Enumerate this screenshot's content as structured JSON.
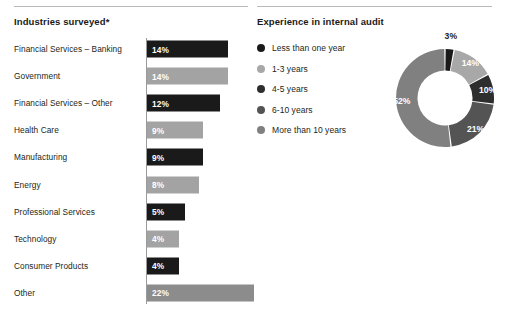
{
  "panels": {
    "industries": {
      "title": "Industries surveyed*"
    },
    "experience": {
      "title": "Experience in internal audit"
    }
  },
  "chart_data": [
    {
      "type": "bar",
      "orientation": "horizontal",
      "title": "Industries surveyed*",
      "xlabel": "",
      "ylabel": "",
      "grid": false,
      "legend": "none",
      "axis_line": true,
      "categories": [
        "Financial Services – Banking",
        "Government",
        "Financial Services – Other",
        "Health Care",
        "Manufacturing",
        "Energy",
        "Professional Services",
        "Technology",
        "Consumer Products",
        "Other"
      ],
      "values": [
        14,
        14,
        12,
        9,
        9,
        8,
        5,
        4,
        4,
        22
      ],
      "value_labels": [
        "14%",
        "14%",
        "12%",
        "9%",
        "9%",
        "8%",
        "5%",
        "4%",
        "4%",
        "22%"
      ],
      "bar_colors": [
        "#1a1a1a",
        "#a3a3a3",
        "#1a1a1a",
        "#a3a3a3",
        "#1a1a1a",
        "#a3a3a3",
        "#1a1a1a",
        "#a3a3a3",
        "#1a1a1a",
        "#8c8c8c"
      ],
      "bar_pixel_widths": [
        81,
        81,
        73,
        56,
        56,
        52,
        38,
        32,
        32,
        107
      ],
      "xlim": [
        0,
        22
      ]
    },
    {
      "type": "pie",
      "variant": "donut",
      "title": "Experience in internal audit",
      "legend": "left",
      "start_angle": 0,
      "direction": "clockwise",
      "categories": [
        "Less than one year",
        "1-3 years",
        "4-5 years",
        "6-10 years",
        "More than 10 years"
      ],
      "values": [
        3,
        14,
        10,
        21,
        52
      ],
      "value_labels": [
        "3%",
        "14%",
        "10%",
        "21%",
        "52%"
      ],
      "slice_colors": [
        "#1a1a1a",
        "#a8a8a8",
        "#2e2e2e",
        "#545454",
        "#808080"
      ],
      "label_placement": [
        "outside",
        "inside",
        "inside",
        "inside",
        "inside"
      ]
    }
  ],
  "legend": {
    "items": [
      {
        "label": "Less than one year",
        "color": "#1a1a1a"
      },
      {
        "label": "1-3 years",
        "color": "#a8a8a8"
      },
      {
        "label": "4-5 years",
        "color": "#2e2e2e"
      },
      {
        "label": "6-10 years",
        "color": "#545454"
      },
      {
        "label": "More than 10 years",
        "color": "#808080"
      }
    ]
  },
  "colors": {
    "rule": "#b9b9b9",
    "axis": "#9a9a9a",
    "text": "#231f20",
    "background": "#ffffff"
  }
}
